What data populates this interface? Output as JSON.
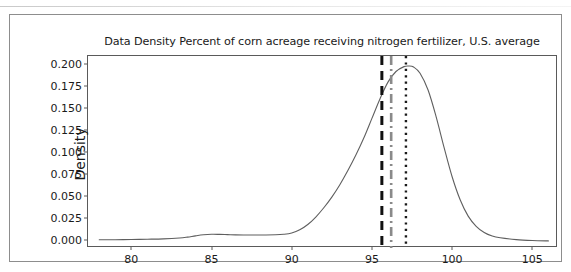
{
  "figure": {
    "title": "Data Density Percent of corn acreage receiving nitrogen fertilizer, U.S. average",
    "background_color": "#ffffff",
    "frame_color": "#8d8d8d"
  },
  "chart_data": {
    "type": "line",
    "title": "Data Density Percent of corn acreage receiving nitrogen fertilizer, U.S. average",
    "xlabel": "",
    "ylabel": "Density",
    "xlim": [
      77.3,
      106.6
    ],
    "ylim": [
      -0.0085,
      0.2085
    ],
    "grid": false,
    "legend": null,
    "xticks": [
      80,
      85,
      90,
      95,
      100,
      105
    ],
    "xticklabels": [
      "80",
      "85",
      "90",
      "95",
      "100",
      "105"
    ],
    "yticks": [
      0.0,
      0.025,
      0.05,
      0.075,
      0.1,
      0.125,
      0.15,
      0.175,
      0.2
    ],
    "yticklabels": [
      "0.000",
      "0.025",
      "0.050",
      "0.075",
      "0.100",
      "0.125",
      "0.150",
      "0.175",
      "0.200"
    ],
    "series": [
      {
        "name": "Kernel density estimate",
        "style": "solid",
        "color": "#5f5f5f",
        "linewidth": 1.1,
        "x": [
          78.0,
          79.0,
          80.0,
          81.0,
          82.0,
          83.0,
          83.5,
          84.0,
          84.5,
          85.0,
          85.5,
          86.0,
          86.5,
          87.0,
          88.0,
          89.0,
          89.5,
          90.0,
          90.5,
          91.0,
          91.5,
          92.0,
          92.5,
          93.0,
          93.5,
          94.0,
          94.5,
          95.0,
          95.5,
          96.0,
          96.5,
          97.0,
          97.3,
          97.6,
          98.0,
          98.5,
          99.0,
          99.5,
          100.0,
          100.5,
          101.0,
          101.5,
          102.0,
          102.5,
          103.0,
          104.0,
          105.0,
          106.0
        ],
        "y": [
          0.0008,
          0.0009,
          0.0011,
          0.0014,
          0.0018,
          0.0028,
          0.0038,
          0.0052,
          0.0064,
          0.007,
          0.0069,
          0.0066,
          0.0063,
          0.0062,
          0.0062,
          0.0064,
          0.007,
          0.0085,
          0.012,
          0.018,
          0.0265,
          0.037,
          0.049,
          0.063,
          0.079,
          0.0965,
          0.116,
          0.138,
          0.16,
          0.179,
          0.191,
          0.1965,
          0.1972,
          0.196,
          0.189,
          0.17,
          0.14,
          0.105,
          0.072,
          0.046,
          0.0275,
          0.016,
          0.009,
          0.005,
          0.003,
          0.001,
          0.0,
          -0.0005
        ]
      }
    ],
    "reference_lines": [
      {
        "name": "line-dashed-black",
        "x": 95.62,
        "style": "dashed",
        "color": "#111111",
        "linewidth": 3.0
      },
      {
        "name": "line-dashdot-gray",
        "x": 96.2,
        "style": "dashdot",
        "color": "#8a8a8a",
        "linewidth": 2.6
      },
      {
        "name": "line-dotted-black",
        "x": 97.12,
        "style": "dotted",
        "color": "#1a1a1a",
        "linewidth": 2.4
      }
    ],
    "peak": {
      "x": 97.3,
      "y": 0.1972
    }
  }
}
